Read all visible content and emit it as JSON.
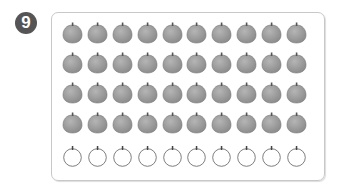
{
  "problem": {
    "number": "9"
  },
  "grid": {
    "columns": 10,
    "rows": [
      {
        "type": "filled",
        "count": 10
      },
      {
        "type": "filled",
        "count": 10
      },
      {
        "type": "filled",
        "count": 10
      },
      {
        "type": "filled",
        "count": 10
      },
      {
        "type": "outline",
        "count": 10
      }
    ],
    "colors": {
      "filled": "#8a8a8a",
      "filled_light": "#b5b5b5",
      "outline": "#6f6f6f",
      "border": "#c8c8c8",
      "badge": "#555555"
    }
  }
}
